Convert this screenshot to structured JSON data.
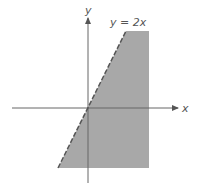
{
  "diagram": {
    "type": "linear-inequality-region",
    "axes": {
      "x_label": "x",
      "y_label": "y"
    },
    "boundary_line": {
      "equation_label": "y = 2x",
      "style": "dashed",
      "slope": 2,
      "intercept": 0
    },
    "shaded_region": {
      "description": "region to the right of / below the line y = 2x",
      "color": "#a8a8a8"
    },
    "colors": {
      "axis": "#666666",
      "shade": "#a8a8a8",
      "line": "#555555",
      "background": "#ffffff"
    }
  }
}
